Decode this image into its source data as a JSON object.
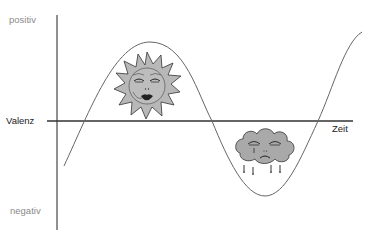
{
  "diagram": {
    "y_axis": {
      "top_label": "positiv",
      "bottom_label": "negativ",
      "title": "Valenz"
    },
    "x_axis": {
      "title": "Zeit"
    },
    "icons": [
      {
        "name": "smiling-sun-icon",
        "position": "peak"
      },
      {
        "name": "crying-cloud-icon",
        "position": "trough"
      }
    ],
    "curve": {
      "description": "sinusoidal valence curve over time",
      "shape": [
        "rises from negative",
        "peak (positive)",
        "crosses zero",
        "trough (negative)",
        "crosses zero",
        "rises"
      ]
    },
    "colors": {
      "axis": "#333333",
      "curve": "#555555",
      "muted_text": "#8a8a8a",
      "icon_fill": "#b5b5b5"
    }
  }
}
